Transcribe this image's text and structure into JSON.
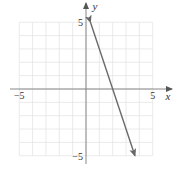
{
  "chart_data": {
    "type": "line",
    "title": "",
    "xlabel": "x",
    "ylabel": "y",
    "xlim": [
      -5,
      5
    ],
    "ylim": [
      -5,
      5
    ],
    "grid": true,
    "grid_step": 1,
    "x_tick_labels": [
      {
        "value": -5,
        "label": "−5"
      },
      {
        "value": 5,
        "label": "5"
      }
    ],
    "y_tick_labels": [
      {
        "value": 5,
        "label": "5"
      },
      {
        "value": -5,
        "label": "−5"
      }
    ],
    "series": [
      {
        "name": "line",
        "equation": "y = -3x + 6",
        "x": [
          0.333,
          3.667
        ],
        "y": [
          5,
          -5
        ],
        "arrows": "both"
      }
    ],
    "legend": null
  },
  "colors": {
    "grid": "#e4e4e4",
    "axis": "#7a7a7a",
    "line": "#6a6a6a",
    "label": "#333333"
  }
}
